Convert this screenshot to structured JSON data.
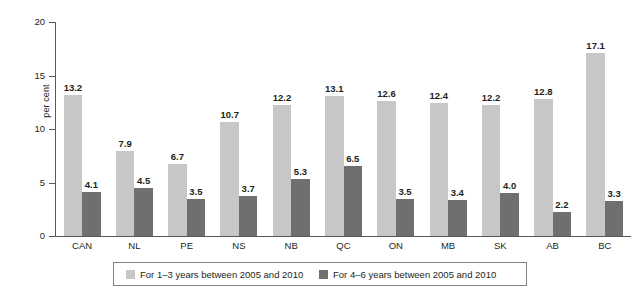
{
  "chart_data": {
    "type": "bar",
    "title": "",
    "xlabel": "",
    "ylabel": "per cent",
    "ylim": [
      0,
      20
    ],
    "yticks": [
      0,
      5,
      10,
      15,
      20
    ],
    "ytick_labels": [
      "0",
      "5",
      "10",
      "15",
      "20"
    ],
    "grid": false,
    "legend_position": "bottom",
    "categories": [
      "CAN",
      "NL",
      "PE",
      "NS",
      "NB",
      "QC",
      "ON",
      "MB",
      "SK",
      "AB",
      "BC"
    ],
    "series": [
      {
        "name": "For 1–3 years between 2005 and 2010",
        "color": "#c7c7c7",
        "values": [
          13.2,
          7.9,
          6.7,
          10.7,
          12.2,
          13.1,
          12.6,
          12.4,
          12.2,
          12.8,
          17.1
        ],
        "labels": [
          "13.2",
          "7.9",
          "6.7",
          "10.7",
          "12.2",
          "13.1",
          "12.6",
          "12.4",
          "12.2",
          "12.8",
          "17.1"
        ]
      },
      {
        "name": "For 4–6 years between 2005 and 2010",
        "color": "#6f6f6f",
        "values": [
          4.1,
          4.5,
          3.5,
          3.7,
          5.3,
          6.5,
          3.5,
          3.4,
          4.0,
          2.2,
          3.3
        ],
        "labels": [
          "4.1",
          "4.5",
          "3.5",
          "3.7",
          "5.3",
          "6.5",
          "3.5",
          "3.4",
          "4.0",
          "2.2",
          "3.3"
        ]
      }
    ]
  },
  "axis": {
    "y_title": "per cent"
  },
  "legend": {
    "items": [
      {
        "label": "For 1–3 years between 2005 and 2010",
        "color": "#c7c7c7"
      },
      {
        "label": "For 4–6 years between 2005 and 2010",
        "color": "#6f6f6f"
      }
    ]
  }
}
